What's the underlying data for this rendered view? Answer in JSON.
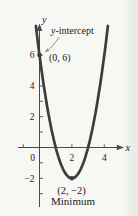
{
  "figure": {
    "background": "#f7f7f4",
    "curve_color": "#3d3d3d",
    "axis_color": "#4a4a4a",
    "text_color": "#1c1c1c",
    "callout_arrow_color": "#8f8f8f"
  },
  "chart_data": {
    "type": "line",
    "x_axis_label": "x",
    "y_axis_label": "y",
    "xlim": [
      -1.4,
      5.2
    ],
    "ylim": [
      -3.9,
      7.9
    ],
    "x_minor_ticks": [
      -1,
      1,
      2,
      3,
      4
    ],
    "y_minor_ticks": [
      -3,
      -2,
      -1,
      1,
      2,
      3,
      4,
      5,
      6
    ],
    "x_tick_labels": [
      {
        "value": 0,
        "label": "0"
      },
      {
        "value": 2,
        "label": "2"
      },
      {
        "value": 4,
        "label": "4"
      }
    ],
    "y_tick_labels": [
      {
        "value": 6,
        "label": "6"
      },
      {
        "value": 4,
        "label": "4"
      },
      {
        "value": 2,
        "label": "2"
      },
      {
        "value": -2,
        "label": "−2"
      }
    ],
    "series": [
      {
        "name": "parabola",
        "a": 2,
        "vertex": {
          "x": 2,
          "y": -2
        },
        "y_intercept": {
          "x": 0,
          "y": 6
        }
      }
    ],
    "marked_points": [
      {
        "x": 0,
        "y": 6,
        "label": "(0, 6)",
        "annotation": "y-intercept"
      },
      {
        "x": 2,
        "y": -2,
        "label": "(2, −2)",
        "annotation": "Minimum"
      }
    ]
  },
  "annotations": {
    "callout_prefix": "y",
    "callout_suffix": "-intercept",
    "point_0_6_label": "(0, 6)",
    "point_2_neg2_label": "(2, −2)",
    "minimum_label": "Minimum"
  }
}
